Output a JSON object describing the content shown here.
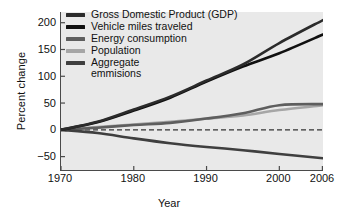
{
  "chart_data": {
    "type": "line",
    "title": "",
    "xlabel": "Year",
    "ylabel": "Percent change",
    "xlim": [
      1970,
      2006
    ],
    "ylim": [
      -75,
      220
    ],
    "xticks": [
      1970,
      1980,
      1990,
      2000,
      2006
    ],
    "yticks": [
      200,
      150,
      100,
      50,
      0,
      -50
    ],
    "grid": false,
    "zero_reference_line": 0,
    "legend_position": "top-left inside plot",
    "x": [
      1970,
      1975,
      1980,
      1985,
      1990,
      1995,
      2000,
      2006
    ],
    "series": [
      {
        "name": "Gross Domestic Product (GDP)",
        "color": "#2b2b2b",
        "values": [
          0,
          15,
          38,
          62,
          92,
          122,
          162,
          205
        ]
      },
      {
        "name": "Vehicle miles traveled",
        "color": "#101010",
        "values": [
          0,
          14,
          36,
          60,
          90,
          118,
          143,
          178
        ]
      },
      {
        "name": "Energy consumption",
        "color": "#5e5e5e",
        "values": [
          0,
          4,
          9,
          13,
          21,
          31,
          46,
          48
        ]
      },
      {
        "name": "Population",
        "color": "#a6a6a6",
        "values": [
          0,
          5,
          10,
          15,
          21,
          27,
          37,
          46
        ]
      },
      {
        "name": "Aggregate\nemmisions",
        "color": "#3f3f3f",
        "values": [
          0,
          -6,
          -16,
          -25,
          -32,
          -38,
          -45,
          -53
        ]
      }
    ]
  },
  "axes": {
    "ylabel": "Percent change",
    "xlabel": "Year",
    "yticks": [
      "200",
      "150",
      "100",
      "50",
      "0",
      "−50"
    ],
    "xticks": [
      "1970",
      "1980",
      "1990",
      "2000",
      "2006"
    ]
  },
  "legend": {
    "items": [
      {
        "label": "Gross Domestic Product (GDP)",
        "color": "#2b2b2b"
      },
      {
        "label": "Vehicle miles traveled",
        "color": "#101010"
      },
      {
        "label": "Energy consumption",
        "color": "#5e5e5e"
      },
      {
        "label": "Population",
        "color": "#a6a6a6"
      },
      {
        "label": "Aggregate\nemmisions",
        "color": "#3f3f3f"
      }
    ]
  },
  "style": {
    "plot_background": "#e9e9e9",
    "page_background": "#ffffff",
    "axis_color": "#4a4a4a",
    "zero_line_color": "#333333"
  }
}
